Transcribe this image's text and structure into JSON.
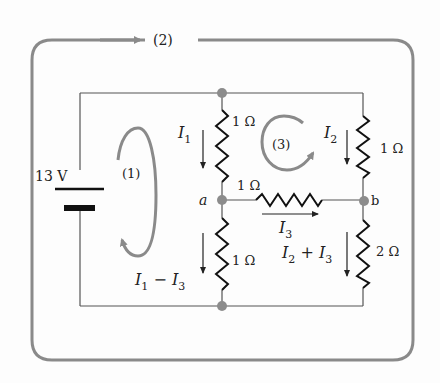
{
  "diagram": {
    "type": "circuit",
    "colors": {
      "wire": "#555555",
      "loop_arrow": "#8a8a8a",
      "node": "#8c8c8c",
      "resistor": "#111111",
      "text": "#222222",
      "background": "#fdfdfd"
    },
    "source": {
      "label": "13 V"
    },
    "loops": [
      {
        "id": "loop-1",
        "label": "(1)"
      },
      {
        "id": "loop-2",
        "label": "(2)"
      },
      {
        "id": "loop-3",
        "label": "(3)"
      }
    ],
    "resistors": [
      {
        "id": "r-top-middle",
        "label": "1 Ω"
      },
      {
        "id": "r-bottom-middle",
        "label": "1 Ω"
      },
      {
        "id": "r-horizontal",
        "label": "1 Ω"
      },
      {
        "id": "r-top-right",
        "label": "1 Ω"
      },
      {
        "id": "r-bottom-right",
        "label": "2 Ω"
      }
    ],
    "nodes": [
      {
        "id": "a",
        "label": "a"
      },
      {
        "id": "b",
        "label": "b"
      }
    ],
    "currents": {
      "i1": {
        "main": "I",
        "sub": "1"
      },
      "i2": {
        "main": "I",
        "sub": "2"
      },
      "i3": {
        "main": "I",
        "sub": "3"
      },
      "i1_minus_i3": {
        "a": "I",
        "a_sub": "1",
        "op": " − ",
        "b": "I",
        "b_sub": "3"
      },
      "i2_plus_i3": {
        "a": "I",
        "a_sub": "2",
        "op": " + ",
        "b": "I",
        "b_sub": "3"
      }
    }
  }
}
